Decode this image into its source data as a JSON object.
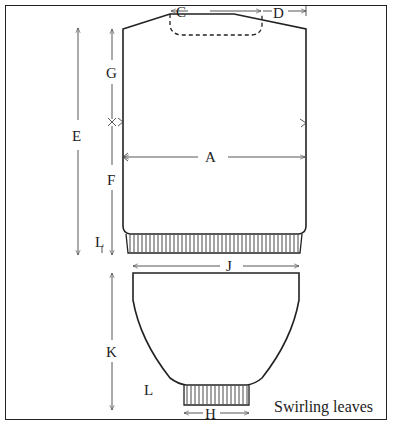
{
  "diagram": {
    "caption": "Swirling leaves",
    "labels": {
      "A": "A",
      "C": "C",
      "D": "D",
      "E": "E",
      "F": "F",
      "G": "G",
      "H": "H",
      "J": "J",
      "K": "K",
      "L1": "L",
      "L2": "L"
    },
    "parts": [
      "body",
      "sleeve"
    ],
    "colors": {
      "stroke": "#222222",
      "background": "#ffffff"
    }
  }
}
